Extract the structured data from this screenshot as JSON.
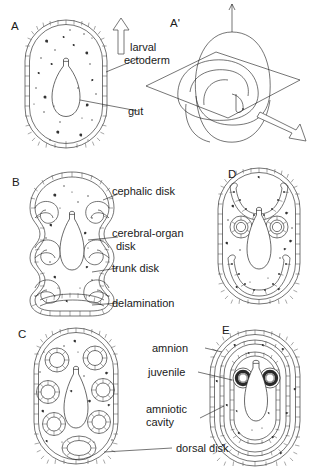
{
  "figure": {
    "background": "#ffffff",
    "ink": "#1a1a1a"
  },
  "panels": [
    {
      "id": "A",
      "letter": "A",
      "caption": "larval section with gut"
    },
    {
      "id": "Ap",
      "letter": "A'",
      "caption": "three-dimensional larva with section plane"
    },
    {
      "id": "B",
      "letter": "B",
      "caption": "invaginating imaginal disks"
    },
    {
      "id": "C",
      "letter": "C",
      "caption": "closed disk vesicles"
    },
    {
      "id": "D",
      "letter": "D",
      "caption": "fusing disks"
    },
    {
      "id": "E",
      "letter": "E",
      "caption": "juvenile within amnion"
    }
  ],
  "labels": {
    "larval_ectoderm": "larval\nectoderm",
    "larval_ectoderm_line1": "larval",
    "larval_ectoderm_line2": "ectoderm",
    "gut": "gut",
    "cephalic_disk": "cephalic disk",
    "cerebral_organ_disk_line1": "cerebral-organ",
    "cerebral_organ_disk_line2": "disk",
    "trunk_disk": "trunk disk",
    "delamination": "delamination",
    "dorsal_disk": "dorsal disk",
    "amnion": "amnion",
    "juvenile": "juvenile",
    "amniotic_cavity_line1": "amniotic",
    "amniotic_cavity_line2": "cavity"
  },
  "arrows": [
    {
      "name": "up-arrow",
      "direction": "up",
      "panel": "A"
    },
    {
      "name": "down-right-arrow",
      "direction": "down-right",
      "panel": "A'"
    }
  ]
}
